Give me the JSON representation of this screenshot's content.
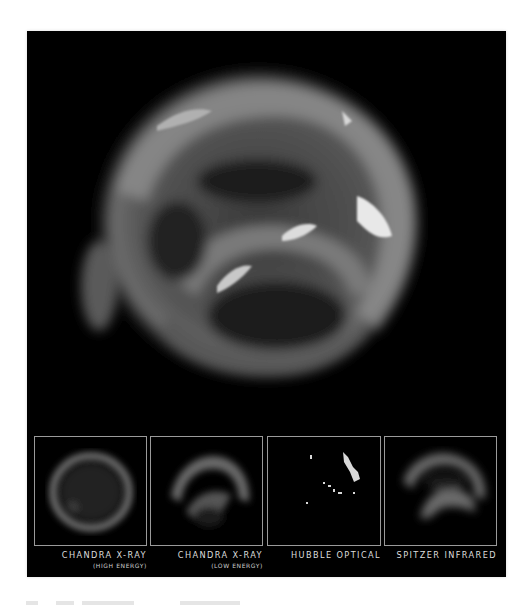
{
  "figure": {
    "background_color": "#000000",
    "page_color": "#ffffff",
    "thumbnail_border_color": "#9a9a9a",
    "label_color": "#dcdcdc"
  },
  "panels": [
    {
      "title": "CHANDRA X-RAY",
      "subtitle": "(HIGH ENERGY)"
    },
    {
      "title": "CHANDRA X-RAY",
      "subtitle": "(LOW ENERGY)"
    },
    {
      "title": "HUBBLE OPTICAL",
      "subtitle": ""
    },
    {
      "title": "SPITZER INFRARED",
      "subtitle": ""
    }
  ]
}
